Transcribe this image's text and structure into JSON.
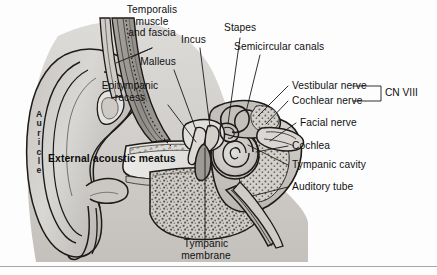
{
  "figure": {
    "kind": "ear-anatomy-cross-section",
    "width": 437,
    "height": 275,
    "background": "#fdfdfd"
  },
  "labels": {
    "temporalis": "Temporalis\nmuscle\nand fascia",
    "malleus": "Malleus",
    "epitympanic": "Epitympanic\nrecess",
    "incus": "Incus",
    "stapes": "Stapes",
    "semicircular": "Semicircular canals",
    "vestibular_nerve": "Vestibular nerve",
    "cochlear_nerve": "Cochlear nerve",
    "cn8": "CN VIII",
    "facial_nerve": "Facial nerve",
    "cochlea": "Cochlea",
    "tympanic_cavity": "Tympanic cavity",
    "auditory_tube": "Auditory tube",
    "external_acoustic_meatus": "External acoustic meatus",
    "auricle": "Auricle",
    "tympanic_membrane": "Tympanic\nmembrane"
  },
  "colors": {
    "ink": "#101010",
    "leader": "#1a1a1a",
    "tissue_light": "#d7d5d2",
    "tissue_mid": "#b3b0ac",
    "tissue_dark": "#8d8a86",
    "bone_fill": "#c9c6c2",
    "canal_fill": "#e6e4e1",
    "shadow": "#7a7774"
  }
}
